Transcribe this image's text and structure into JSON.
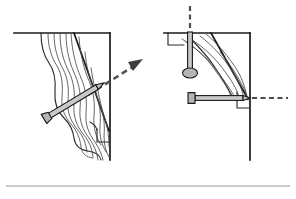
{
  "figure": {
    "background_color": "#ffffff",
    "ink_color": "#1a1a1a",
    "grain_color": "#4a4a4a",
    "nail_fill_color": "#c9c9c9",
    "trajectory_color": "#555555",
    "baseline_color": "#9a9a9a",
    "panel_count": 2
  },
  "panels": [
    {
      "id": "left-panel",
      "name": "angled-nailing-diagram",
      "description": "Nail driven at an upward-right angle through torn, splintered wood fibers; dashed trajectory arrow continues up and to the right past the board edge.",
      "workpiece": {
        "name": "board-section-left",
        "top_edge": {
          "x1": 14,
          "y1": 33,
          "x2": 110,
          "y2": 33
        },
        "right_edge": {
          "x1": 110,
          "y1": 33,
          "x2": 110,
          "y2": 160
        },
        "crack_line": {
          "x1": 74,
          "y1": 33,
          "x2": 108,
          "y2": 132
        },
        "notch": {
          "x": 100,
          "y": 128,
          "w": 10,
          "h": 14
        }
      },
      "grain_lines": 9,
      "nail": {
        "name": "nail-angled",
        "head_x": 44,
        "head_y": 119,
        "tip_x": 104,
        "tip_y": 83,
        "angle_deg": -31
      },
      "trajectory": {
        "name": "trajectory-arrow-angled",
        "start_x": 88,
        "start_y": 94,
        "end_x": 142,
        "end_y": 60,
        "arrowhead": "up-right"
      }
    },
    {
      "id": "right-panel",
      "name": "perpendicular-nailing-diagram",
      "description": "One nail driven straight down from above through the top face and a second nail driven horizontally into the end grain; dashed trajectories show both driving directions.",
      "workpiece": {
        "name": "board-section-right",
        "top_edge": {
          "x1": 164,
          "y1": 33,
          "x2": 250,
          "y2": 33
        },
        "right_edge": {
          "x1": 250,
          "y1": 33,
          "x2": 250,
          "y2": 160
        },
        "crack_line": {
          "x1": 212,
          "y1": 33,
          "x2": 248,
          "y2": 100
        },
        "notch": {
          "x": 240,
          "y": 96,
          "w": 10,
          "h": 12
        },
        "left_notch": {
          "x": 168,
          "y": 33,
          "w": 16,
          "h": 12
        }
      },
      "grain_lines": 6,
      "nails": [
        {
          "name": "nail-vertical",
          "head_x": 190,
          "head_y": 74,
          "tip_x": 190,
          "tip_y": 30,
          "orientation": "vertical-down"
        },
        {
          "name": "nail-horizontal",
          "head_x": 189,
          "head_y": 98,
          "tip_x": 246,
          "tip_y": 98,
          "orientation": "horizontal-right"
        }
      ],
      "trajectories": [
        {
          "name": "trajectory-vertical",
          "start_x": 190,
          "start_y": 8,
          "end_x": 190,
          "end_y": 32,
          "direction": "down"
        },
        {
          "name": "trajectory-horizontal",
          "start_x": 248,
          "start_y": 98,
          "end_x": 288,
          "end_y": 98,
          "direction": "right"
        }
      ]
    }
  ],
  "baseline": {
    "name": "page-baseline-rule",
    "x1": 6,
    "y1": 186,
    "x2": 290,
    "y2": 186
  }
}
